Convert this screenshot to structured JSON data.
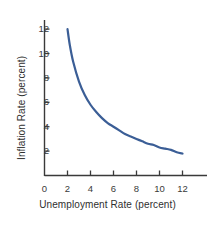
{
  "chart_data": {
    "type": "line",
    "title": "",
    "subtitle": "",
    "xlabel": "Unemployment Rate (percent)",
    "ylabel": "Inflation Rate (percent)",
    "xlim": [
      0,
      14
    ],
    "ylim": [
      0,
      13
    ],
    "xticks": [
      0,
      2,
      4,
      6,
      8,
      10,
      12
    ],
    "yticks": [
      2,
      4,
      6,
      8,
      10,
      12
    ],
    "xtick_labels": [
      "0",
      "2",
      "4",
      "6",
      "8",
      "10",
      "12"
    ],
    "ytick_labels": [
      "2",
      "4",
      "6",
      "8",
      "10",
      "12"
    ],
    "grid": false,
    "legend": null,
    "legend_position": "none",
    "annotations": [],
    "series": [
      {
        "name": "Phillips curve",
        "color": "#3b5e96",
        "linewidth": 2.2,
        "x": [
          2.0,
          2.2,
          2.5,
          3.0,
          3.5,
          4.0,
          4.5,
          5.0,
          5.5,
          6.0,
          6.5,
          7.0,
          7.5,
          8.0,
          8.5,
          9.0,
          9.5,
          10.0,
          10.5,
          11.0,
          11.5,
          12.0
        ],
        "y": [
          12.0,
          10.7,
          9.3,
          7.7,
          6.6,
          5.8,
          5.2,
          4.7,
          4.3,
          4.0,
          3.7,
          3.4,
          3.2,
          3.0,
          2.8,
          2.6,
          2.5,
          2.3,
          2.2,
          2.1,
          1.9,
          1.8
        ]
      }
    ]
  },
  "axis": {
    "line_color": "#3a3a3a",
    "tick_color": "#3a3a3a"
  },
  "ticks": {
    "x": [
      {
        "label": "0",
        "value": 0
      },
      {
        "label": "2",
        "value": 2
      },
      {
        "label": "4",
        "value": 4
      },
      {
        "label": "6",
        "value": 6
      },
      {
        "label": "8",
        "value": 8
      },
      {
        "label": "10",
        "value": 10
      },
      {
        "label": "12",
        "value": 12
      }
    ],
    "y": [
      {
        "label": "2",
        "value": 2
      },
      {
        "label": "4",
        "value": 4
      },
      {
        "label": "6",
        "value": 6
      },
      {
        "label": "8",
        "value": 8
      },
      {
        "label": "10",
        "value": 10
      },
      {
        "label": "12",
        "value": 12
      }
    ]
  }
}
